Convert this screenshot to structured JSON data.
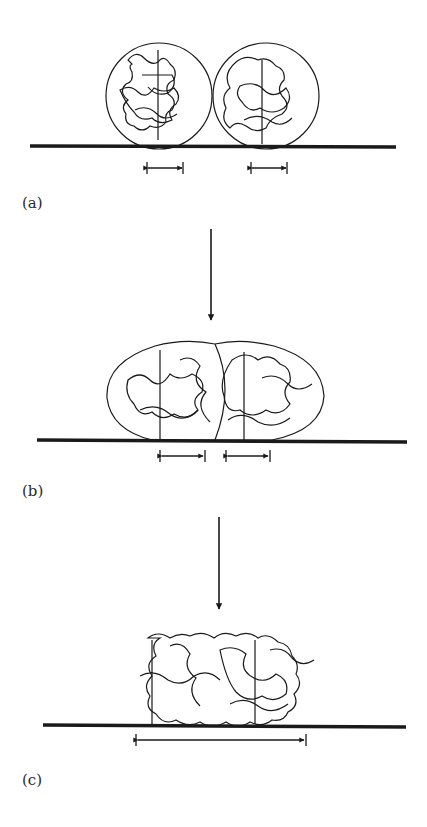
{
  "panels": [
    {
      "id": "a",
      "label": "(a)",
      "description": "Two separate spherical polymer particles resting on substrate, each with small contact width"
    },
    {
      "id": "b",
      "label": "(b)",
      "description": "Particles deformed and partially coalesced, contact widths increased"
    },
    {
      "id": "c",
      "label": "(c)",
      "description": "Fully coalesced polymer chains forming a continuous film with a single wide contact"
    }
  ],
  "colors": {
    "line": "#1a1a1a",
    "background": "#ffffff"
  }
}
